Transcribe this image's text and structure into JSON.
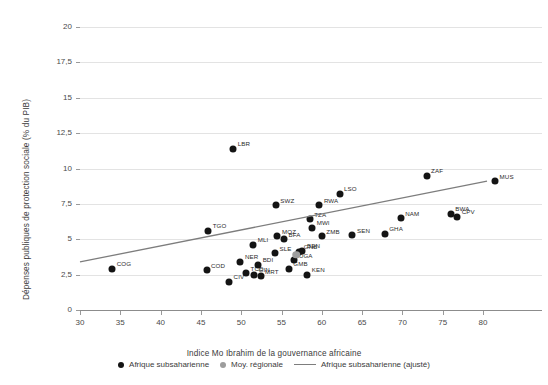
{
  "chart_data": {
    "type": "scatter",
    "title": "",
    "xlabel": "Indice Mo Ibrahim de la gouvernance africaine",
    "ylabel": "Dépenses publiques de protection sociale (% du PIB)",
    "xlim": [
      30,
      82
    ],
    "ylim": [
      0,
      20
    ],
    "xticks": [
      "30",
      "35",
      "40",
      "45",
      "50",
      "55",
      "60",
      "65",
      "70",
      "75",
      "80"
    ],
    "xtick_values": [
      30,
      35,
      40,
      45,
      50,
      55,
      60,
      65,
      70,
      75,
      80
    ],
    "yticks": [
      "0",
      "2,5",
      "5",
      "7,5",
      "10",
      "12,5",
      "15",
      "17,5",
      "20"
    ],
    "ytick_values": [
      0,
      2.5,
      5,
      7.5,
      10,
      12.5,
      15,
      17.5,
      20
    ],
    "grid": "horizontal",
    "legend_position": "bottom",
    "series": [
      {
        "name": "Afrique subsaharienne",
        "marker": "circle",
        "color": "#141414",
        "points": [
          {
            "label": "COG",
            "x": 34.0,
            "y": 2.9
          },
          {
            "label": "COD",
            "x": 45.7,
            "y": 2.8
          },
          {
            "label": "TGO",
            "x": 45.9,
            "y": 5.6
          },
          {
            "label": "CIV",
            "x": 48.5,
            "y": 2.0
          },
          {
            "label": "LBR",
            "x": 49.0,
            "y": 11.4
          },
          {
            "label": "NER",
            "x": 49.9,
            "y": 3.4
          },
          {
            "label": "TCD",
            "x": 50.6,
            "y": 2.6
          },
          {
            "label": "MLI",
            "x": 51.5,
            "y": 4.6
          },
          {
            "label": "GIN",
            "x": 51.6,
            "y": 2.5
          },
          {
            "label": "BDI",
            "x": 52.1,
            "y": 3.2
          },
          {
            "label": "MRT",
            "x": 52.4,
            "y": 2.4
          },
          {
            "label": "MOZ",
            "x": 54.5,
            "y": 5.2
          },
          {
            "label": "SWZ",
            "x": 54.3,
            "y": 7.4
          },
          {
            "label": "BFA",
            "x": 55.3,
            "y": 5.0
          },
          {
            "label": "SLE",
            "x": 54.2,
            "y": 4.0
          },
          {
            "label": "GMB",
            "x": 55.9,
            "y": 2.9
          },
          {
            "label": "UGA",
            "x": 56.6,
            "y": 3.5
          },
          {
            "label": "GNB",
            "x": 57.2,
            "y": 4.1
          },
          {
            "label": "BEN",
            "x": 57.6,
            "y": 4.2
          },
          {
            "label": "KEN",
            "x": 58.2,
            "y": 2.5
          },
          {
            "label": "TZA",
            "x": 58.5,
            "y": 6.4
          },
          {
            "label": "MWI",
            "x": 58.8,
            "y": 5.8
          },
          {
            "label": "RWA",
            "x": 59.7,
            "y": 7.4
          },
          {
            "label": "ZMB",
            "x": 60.0,
            "y": 5.2
          },
          {
            "label": "LSO",
            "x": 62.2,
            "y": 8.2
          },
          {
            "label": "SEN",
            "x": 63.8,
            "y": 5.3
          },
          {
            "label": "GHA",
            "x": 67.8,
            "y": 5.4
          },
          {
            "label": "NAM",
            "x": 69.8,
            "y": 6.5
          },
          {
            "label": "ZAF",
            "x": 73.0,
            "y": 9.5
          },
          {
            "label": "BWA",
            "x": 76.0,
            "y": 6.8
          },
          {
            "label": "CPV",
            "x": 76.8,
            "y": 6.6
          },
          {
            "label": "MUS",
            "x": 81.5,
            "y": 9.1
          }
        ]
      },
      {
        "name": "Moy. régionale",
        "marker": "circle",
        "color": "#9d9d9d",
        "points": [
          {
            "label": "",
            "x": 56.8,
            "y": 3.9
          }
        ]
      }
    ],
    "trendline": {
      "name": "Afrique subsaharienne (ajusté)",
      "color": "#7d7d7d",
      "x0": 30.0,
      "y0": 3.4,
      "x1": 80.5,
      "y1": 9.1
    }
  },
  "legend": {
    "items": [
      {
        "label": "Afrique subsaharienne",
        "marker": "dot"
      },
      {
        "label": "Moy. régionale",
        "marker": "dot-gray"
      },
      {
        "label": "Afrique subsaharienne (ajusté)",
        "marker": "line"
      }
    ]
  }
}
